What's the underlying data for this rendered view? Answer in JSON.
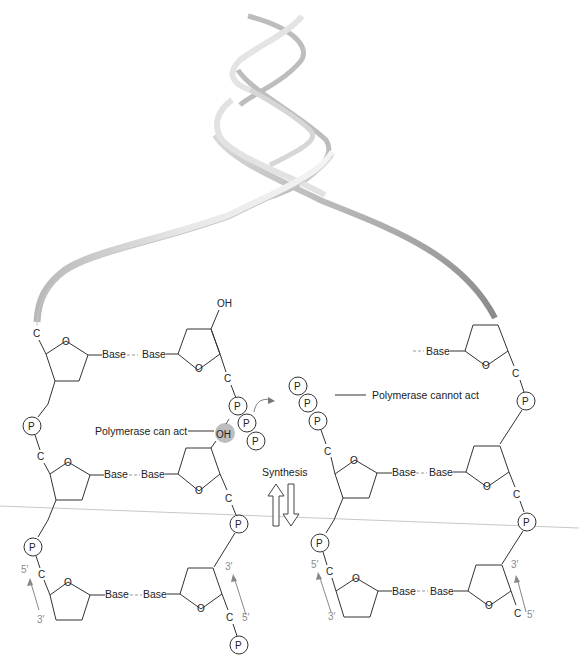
{
  "figure": {
    "topic": "DNA replication - polymerase direction and synthesis",
    "labels": {
      "polymerase_can_act": "Polymerase can act",
      "polymerase_cannot_act": "Polymerase cannot act",
      "synthesis": "Synthesis"
    },
    "atoms": {
      "carbon": "C",
      "oxygen": "O",
      "hydroxyl": "OH",
      "phosphate": "P",
      "base": "Base"
    },
    "ends": {
      "five_prime": "5′",
      "three_prime": "3′"
    },
    "colors": {
      "line": "#333333",
      "ribbon_light": "#e6e6e6",
      "ribbon_dark": "#9a9a9a",
      "prime_label": "#8a8a8a",
      "oh_highlight": "#bdbdbd"
    }
  }
}
